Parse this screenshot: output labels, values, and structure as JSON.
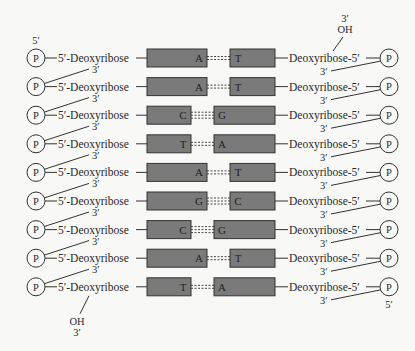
{
  "diagram": {
    "title": "",
    "colors": {
      "background": "#f8f8f6",
      "base_box_fill": "#7a7a7a",
      "base_box_stroke": "#333333",
      "line": "#333333",
      "text": "#2a2a2a"
    },
    "left_strand": {
      "end_top_label": "5′",
      "end_bottom_labels": [
        "OH",
        "3′"
      ],
      "sugar_label": "5′-Deoxyribose",
      "phosphate_label": "P",
      "linkage_label": "3′"
    },
    "right_strand": {
      "end_top_labels": [
        "3′",
        "OH"
      ],
      "end_bottom_label": "5′",
      "sugar_label": "Deoxyribose-5′",
      "phosphate_label": "P",
      "linkage_label": "3′"
    },
    "base_pairs": [
      {
        "left": "A",
        "right": "T",
        "hbonds": 2
      },
      {
        "left": "A",
        "right": "T",
        "hbonds": 2
      },
      {
        "left": "C",
        "right": "G",
        "hbonds": 3
      },
      {
        "left": "T",
        "right": "A",
        "hbonds": 2
      },
      {
        "left": "A",
        "right": "T",
        "hbonds": 2
      },
      {
        "left": "G",
        "right": "C",
        "hbonds": 3
      },
      {
        "left": "C",
        "right": "G",
        "hbonds": 3
      },
      {
        "left": "A",
        "right": "T",
        "hbonds": 2
      },
      {
        "left": "T",
        "right": "A",
        "hbonds": 2
      }
    ]
  }
}
